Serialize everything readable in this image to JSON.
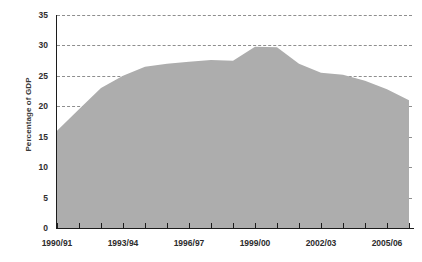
{
  "chart_data": {
    "type": "area",
    "title": "",
    "xlabel": "",
    "ylabel": "Percentage of GDP",
    "ylim": [
      0,
      35
    ],
    "ytick_step": 5,
    "yticks": [
      0,
      5,
      10,
      15,
      20,
      25,
      30,
      35
    ],
    "grid": true,
    "legend": null,
    "fill_color": "#adadad",
    "grid_color": "#8e8e8e",
    "axis_color": "#1c1c1c",
    "categories": [
      "1990/91",
      "1991/92",
      "1992/93",
      "1993/94",
      "1994/95",
      "1995/96",
      "1996/97",
      "1997/98",
      "1998/99",
      "1999/00",
      "2000/01",
      "2001/02",
      "2002/03",
      "2003/04",
      "2004/05",
      "2005/06",
      "2006/07"
    ],
    "xtick_labels_shown": [
      "1990/91",
      "1993/94",
      "1996/97",
      "1999/00",
      "2002/03",
      "2005/06"
    ],
    "values": [
      16.0,
      19.5,
      23.0,
      25.0,
      26.5,
      27.0,
      27.3,
      27.6,
      27.5,
      29.8,
      29.7,
      27.0,
      25.5,
      25.2,
      24.2,
      22.8,
      21.0
    ]
  },
  "axis": {
    "y_title": "Percentage of GDP",
    "y_tick_labels": [
      "35",
      "30",
      "25",
      "20",
      "15",
      "10",
      "5",
      "0"
    ],
    "x_tick_labels": [
      "1990/91",
      "1993/94",
      "1996/97",
      "1999/00",
      "2002/03",
      "2005/06"
    ]
  }
}
